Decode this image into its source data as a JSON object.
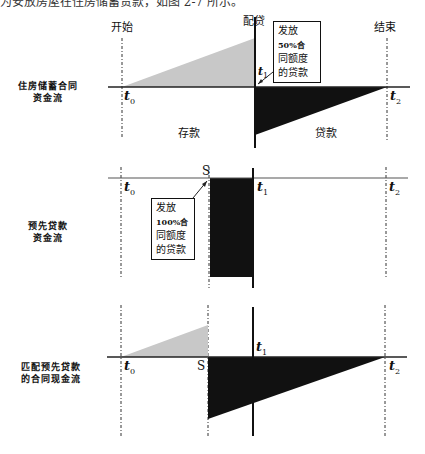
{
  "caption_fragment": "为安放房屋在住房储蓄贷款，如图 2-7 所示。",
  "headers": {
    "start": "开始",
    "allocation": "配贷",
    "end": "结束"
  },
  "panels": [
    {
      "label_line1": "住房储蓄合同",
      "label_line2": "资金流",
      "callout": [
        "发放",
        "50%合",
        "同额度",
        "的贷款"
      ],
      "area_left": "存款",
      "area_right": "贷款",
      "time_labels": {
        "t0": "t",
        "t0_sub": "0",
        "t1": "t",
        "t1_sub": "1",
        "t2": "t",
        "t2_sub": "2"
      }
    },
    {
      "label_line1": "预先贷款",
      "label_line2": "资金流",
      "callout": [
        "发放",
        "100%合",
        "同额度",
        "的贷款"
      ],
      "s_label": "S",
      "time_labels": {
        "t0": "t",
        "t0_sub": "0",
        "t1": "t",
        "t1_sub": "1",
        "t2": "t",
        "t2_sub": "2"
      }
    },
    {
      "label_line1": "匹配预先贷款",
      "label_line2": "的合同现金流",
      "s_label": "S",
      "time_labels": {
        "t0": "t",
        "t0_sub": "0",
        "t1": "t",
        "t1_sub": "1",
        "t2": "t",
        "t2_sub": "2"
      }
    }
  ],
  "colors": {
    "deposit_fill": "#c8c8c8",
    "loan_fill": "#111111",
    "axis": "#222222"
  }
}
